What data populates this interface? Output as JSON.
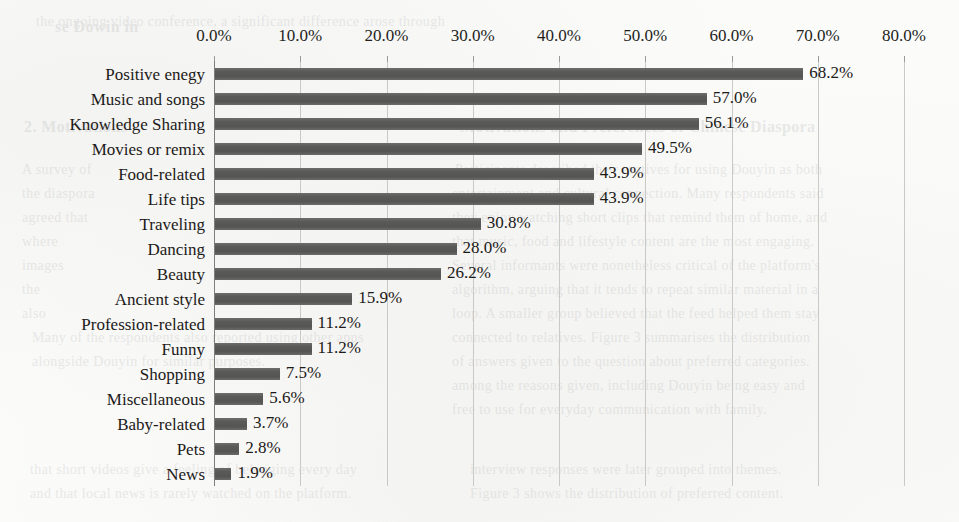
{
  "chart_data": {
    "type": "bar",
    "orientation": "horizontal",
    "title": "",
    "xlabel": "",
    "ylabel": "",
    "xlim": [
      0,
      80
    ],
    "xtick_labels": [
      "0.0%",
      "10.0%",
      "20.0%",
      "30.0%",
      "40.0%",
      "50.0%",
      "60.0%",
      "70.0%",
      "80.0%"
    ],
    "xticks": [
      0,
      10,
      20,
      30,
      40,
      50,
      60,
      70,
      80
    ],
    "grid": "vertical",
    "legend": "none",
    "bar_color": "#5a5a58",
    "gridline_color": "#c9c9c6",
    "background_color": "#fbfbfa",
    "categories": [
      "Positive enegy",
      "Music and songs",
      "Knowledge Sharing",
      "Movies or remix",
      "Food-related",
      "Life tips",
      "Traveling",
      "Dancing",
      "Beauty",
      "Ancient style",
      "Profession-related",
      "Funny",
      "Shopping",
      "Miscellaneous",
      "Baby-related",
      "Pets",
      "News"
    ],
    "values": [
      68.2,
      57.0,
      56.1,
      49.5,
      43.9,
      43.9,
      30.8,
      28.0,
      26.2,
      15.9,
      11.2,
      11.2,
      7.5,
      5.6,
      3.7,
      2.8,
      1.9
    ],
    "value_labels": [
      "68.2%",
      "57.0%",
      "56.1%",
      "49.5%",
      "43.9%",
      "43.9%",
      "30.8%",
      "28.0%",
      "26.2%",
      "15.9%",
      "11.2%",
      "11.2%",
      "7.5%",
      "5.6%",
      "3.7%",
      "2.8%",
      "1.9%"
    ]
  },
  "scan_bleed": {
    "lines": [
      {
        "text": "se Dowin in",
        "x": 55,
        "y": 18,
        "size": 16,
        "bold": true
      },
      {
        "text": "the ongoing video conference, a significant difference arose through",
        "x": 36,
        "y": 14,
        "size": 14,
        "bold": false
      },
      {
        "text": "Motivations and Preferences of Chinese Diaspora",
        "x": 460,
        "y": 118,
        "size": 16,
        "bold": true
      },
      {
        "text": "Participants described their motives for using Douyin as both",
        "x": 455,
        "y": 162,
        "size": 14,
        "bold": false
      },
      {
        "text": "entertainment and cultural connection. Many respondents said",
        "x": 452,
        "y": 186,
        "size": 14,
        "bold": false
      },
      {
        "text": "they enjoy watching short clips that remind them of home, and",
        "x": 452,
        "y": 210,
        "size": 14,
        "bold": false
      },
      {
        "text": "that music, food and lifestyle content are the most engaging.",
        "x": 452,
        "y": 234,
        "size": 14,
        "bold": false
      },
      {
        "text": "Several informants were nonetheless critical of the platform's",
        "x": 452,
        "y": 258,
        "size": 14,
        "bold": false
      },
      {
        "text": "algorithm, arguing that it tends to repeat similar material in a",
        "x": 452,
        "y": 282,
        "size": 14,
        "bold": false
      },
      {
        "text": "loop. A smaller group believed that the feed helped them stay",
        "x": 452,
        "y": 306,
        "size": 14,
        "bold": false
      },
      {
        "text": "connected to relatives. Figure 3 summarises the distribution",
        "x": 452,
        "y": 330,
        "size": 14,
        "bold": false
      },
      {
        "text": "of answers given to the question about preferred categories.",
        "x": 452,
        "y": 354,
        "size": 14,
        "bold": false
      },
      {
        "text": "among the reasons given, including Douyin being easy and",
        "x": 452,
        "y": 378,
        "size": 14,
        "bold": false
      },
      {
        "text": "free to use for everyday communication with family.",
        "x": 452,
        "y": 402,
        "size": 14,
        "bold": false
      },
      {
        "text": "Many of the respondents also reported using other apps",
        "x": 32,
        "y": 330,
        "size": 14,
        "bold": false
      },
      {
        "text": "alongside Douyin for similar purposes.",
        "x": 32,
        "y": 354,
        "size": 14,
        "bold": false
      },
      {
        "text": "2. Motivations",
        "x": 24,
        "y": 118,
        "size": 16,
        "bold": true
      },
      {
        "text": "A survey of",
        "x": 22,
        "y": 162,
        "size": 14,
        "bold": false
      },
      {
        "text": "the diaspora",
        "x": 22,
        "y": 186,
        "size": 14,
        "bold": false
      },
      {
        "text": "agreed that",
        "x": 22,
        "y": 210,
        "size": 14,
        "bold": false
      },
      {
        "text": "where",
        "x": 22,
        "y": 234,
        "size": 14,
        "bold": false
      },
      {
        "text": "images",
        "x": 22,
        "y": 258,
        "size": 14,
        "bold": false
      },
      {
        "text": "the",
        "x": 22,
        "y": 282,
        "size": 14,
        "bold": false
      },
      {
        "text": "also",
        "x": 22,
        "y": 306,
        "size": 14,
        "bold": false
      },
      {
        "text": "that short videos give a feeling of belonging every day",
        "x": 30,
        "y": 462,
        "size": 14,
        "bold": false
      },
      {
        "text": "and that local news is rarely watched on the platform.",
        "x": 30,
        "y": 486,
        "size": 14,
        "bold": false
      },
      {
        "text": "interview responses were later grouped into themes.",
        "x": 470,
        "y": 462,
        "size": 14,
        "bold": false
      },
      {
        "text": "Figure 3 shows the distribution of preferred content.",
        "x": 470,
        "y": 486,
        "size": 14,
        "bold": false
      }
    ]
  }
}
